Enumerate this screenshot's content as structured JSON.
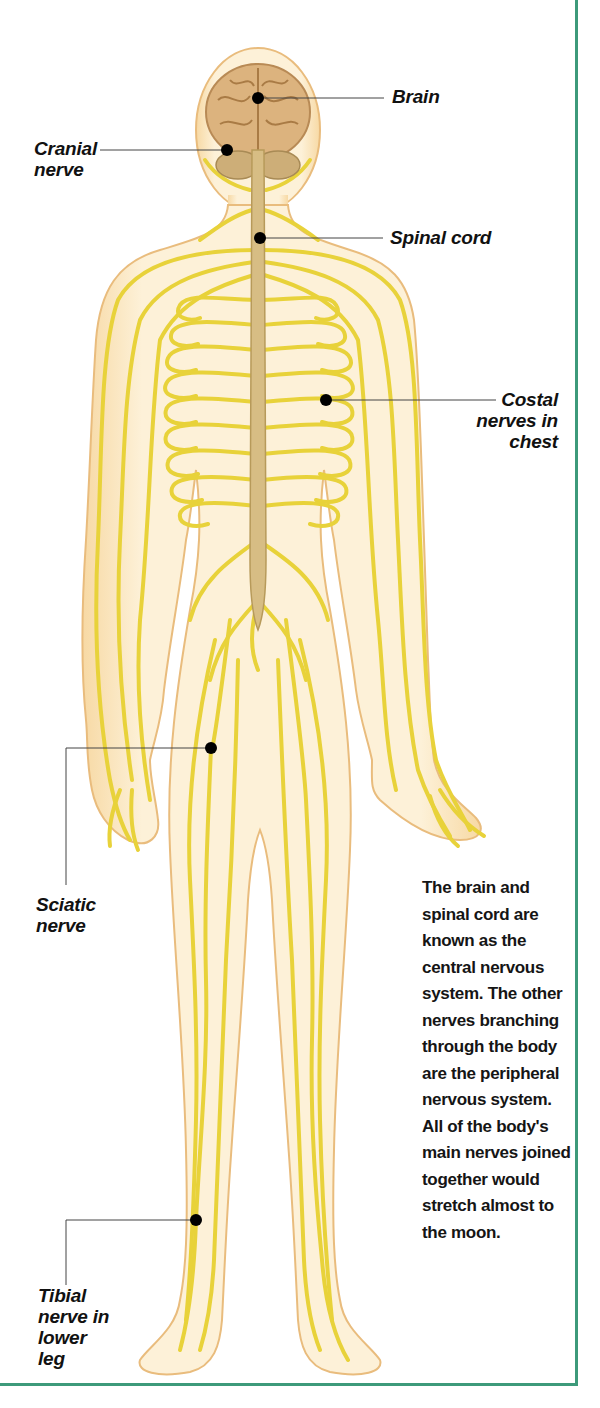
{
  "header": {
    "caption_fragment": "the brain and the nerves"
  },
  "colors": {
    "border": "#3d9a7a",
    "skin": "#fbe9c6",
    "skin_outline": "#e6b877",
    "nerve": "#e8d23a",
    "nerve_outline": "#b59a1a",
    "brain": "#d9b07a",
    "spinal_cord": "#d4b57a",
    "leader_dot": "#000000"
  },
  "labels": {
    "brain": "Brain",
    "cranial_nerve_1": "Cranial",
    "cranial_nerve_2": "nerve",
    "spinal_cord": "Spinal cord",
    "costal_1": "Costal",
    "costal_2": "nerves in",
    "costal_3": "chest",
    "sciatic_1": "Sciatic",
    "sciatic_2": "nerve",
    "tibial_1": "Tibial",
    "tibial_2": "nerve in",
    "tibial_3": "lower",
    "tibial_4": "leg"
  },
  "description": "The brain and spinal cord are known as the central nervous system. The other nerves branching through the body are the peripheral nervous system. All of the body's main nerves joined together would stretch almost to the moon."
}
